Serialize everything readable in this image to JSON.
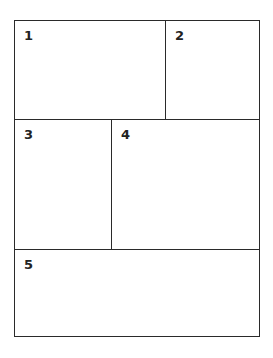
{
  "diagram": {
    "type": "panel-layout",
    "panels": [
      {
        "id": "1",
        "label": "1"
      },
      {
        "id": "2",
        "label": "2"
      },
      {
        "id": "3",
        "label": "3"
      },
      {
        "id": "4",
        "label": "4"
      },
      {
        "id": "5",
        "label": "5"
      }
    ],
    "line_color": "#2a2a2a",
    "background": "#ffffff"
  }
}
